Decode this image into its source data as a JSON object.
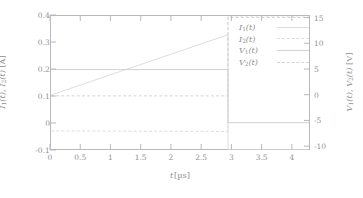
{
  "chart_data": {
    "type": "line",
    "title": "",
    "xlabel": "t [µs]",
    "ylabel": "I₁(t), I₂(t) [A]",
    "y2label": "V₁(t), V₂(t) [V]",
    "xlim": [
      0,
      4.3
    ],
    "ylim": [
      -0.1,
      0.4
    ],
    "y2lim": [
      -10.75,
      15.5
    ],
    "grid": false,
    "legend_position": "upper right",
    "xticks": [
      "0",
      "0.5",
      "1",
      "1.5",
      "2",
      "2.5",
      "3",
      "3.5",
      "4"
    ],
    "xtick_values": [
      0,
      0.5,
      1,
      1.5,
      2,
      2.5,
      3,
      3.5,
      4
    ],
    "yticks": [
      "0.4",
      "0.3",
      "0.2",
      "0.1",
      "0",
      "-0.1"
    ],
    "ytick_values": [
      0.4,
      0.3,
      0.2,
      0.1,
      0,
      -0.1
    ],
    "y2ticks": [
      "15",
      "10",
      "5",
      "0",
      "-5",
      "-10"
    ],
    "y2tick_values": [
      15,
      10,
      5,
      0,
      -5,
      -10
    ],
    "switching_time": 2.95,
    "series": [
      {
        "name": "I₁(t)",
        "axis": "left",
        "style": "solid",
        "color": "#dddddd",
        "x": [
          0,
          2.95,
          2.95,
          4.3
        ],
        "y": [
          0.105,
          0.33,
          -0.1,
          -0.1
        ]
      },
      {
        "name": "I₂(t)",
        "axis": "left",
        "style": "dashed",
        "color": "#dcdcdc",
        "x": [
          0,
          2.95,
          2.95,
          4.3
        ],
        "y": [
          -0.029,
          -0.031,
          0.4,
          0.4
        ]
      },
      {
        "name": "V₁(t)",
        "axis": "right",
        "style": "solid",
        "color": "#d2d2d2",
        "x": [
          0,
          2.95,
          2.95,
          4.3
        ],
        "y": [
          5,
          5,
          -5.4,
          -5.4
        ]
      },
      {
        "name": "V₂(t)",
        "axis": "right",
        "style": "dashed",
        "color": "#d4d4d4",
        "x": [
          0,
          2.95,
          2.95,
          4.3
        ],
        "y": [
          -0.15,
          -0.15,
          15.2,
          15.2
        ]
      }
    ]
  },
  "axes": {
    "ylabel_parts": {
      "i1": "I",
      "sub1": "1",
      "t": "(t)",
      "i2": "I",
      "sub2": "2",
      "unit": "[A]"
    },
    "y2label_parts": {
      "v1": "V",
      "sub1": "1",
      "t": "(t)",
      "v2": "V",
      "sub2": "2",
      "unit": "[V]"
    },
    "xlabel_var": "t",
    "xlabel_unit": "[µs]"
  },
  "legend": {
    "items": [
      {
        "label": "I₁(t)",
        "style": "solid"
      },
      {
        "label": "I₂(t)",
        "style": "dashed"
      },
      {
        "label": "V₁(t)",
        "style": "solid"
      },
      {
        "label": "V₂(t)",
        "style": "dashed"
      }
    ]
  }
}
